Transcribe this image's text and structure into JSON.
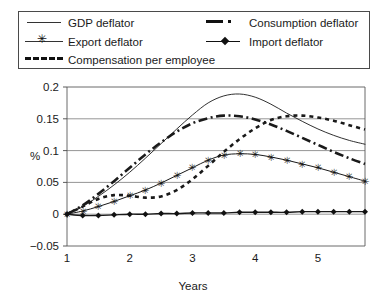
{
  "legend": {
    "entries": [
      {
        "label": "GDP deflator",
        "style": "solid-thin",
        "icon": "line-sample-solid-icon"
      },
      {
        "label": "Export deflator",
        "style": "star",
        "icon": "line-sample-star-icon"
      },
      {
        "label": "Compensation per employee",
        "style": "dash",
        "icon": "line-sample-dashed-icon"
      },
      {
        "label": "Consumption deflator",
        "style": "dashdot",
        "icon": "line-sample-dashdot-icon"
      },
      {
        "label": "Import deflator",
        "style": "diamond",
        "icon": "line-sample-diamond-icon"
      }
    ]
  },
  "axes": {
    "y_label": "%",
    "x_label": "Years",
    "y_ticks": [
      "0.2",
      "0.15",
      "0.1",
      "0.05",
      "0",
      "−0.05"
    ],
    "x_ticks": [
      "1",
      "2",
      "3",
      "4",
      "5"
    ]
  },
  "chart_data": {
    "type": "line",
    "title": "",
    "xlabel": "Years",
    "ylabel": "%",
    "xlim": [
      1,
      5.75
    ],
    "ylim": [
      -0.05,
      0.2
    ],
    "yticks": [
      -0.05,
      0,
      0.05,
      0.1,
      0.15,
      0.2
    ],
    "xticks": [
      1,
      2,
      3,
      4,
      5
    ],
    "grid": "horizontal",
    "legend_position": "top",
    "x": [
      1,
      1.25,
      1.5,
      1.75,
      2,
      2.25,
      2.5,
      2.75,
      3,
      3.25,
      3.5,
      3.75,
      4,
      4.25,
      4.5,
      4.75,
      5,
      5.25,
      5.5,
      5.75
    ],
    "series": [
      {
        "name": "GDP deflator",
        "style": "solid-thin",
        "values": [
          0.0,
          0.012,
          0.028,
          0.046,
          0.066,
          0.088,
          0.111,
          0.134,
          0.156,
          0.175,
          0.186,
          0.189,
          0.184,
          0.173,
          0.159,
          0.146,
          0.134,
          0.124,
          0.116,
          0.11
        ]
      },
      {
        "name": "Consumption deflator",
        "style": "dashdot",
        "values": [
          0.0,
          0.014,
          0.032,
          0.052,
          0.073,
          0.094,
          0.113,
          0.13,
          0.143,
          0.151,
          0.155,
          0.154,
          0.149,
          0.141,
          0.131,
          0.12,
          0.109,
          0.098,
          0.088,
          0.079
        ]
      },
      {
        "name": "Export deflator",
        "style": "star",
        "values": [
          0.0,
          0.005,
          0.012,
          0.02,
          0.029,
          0.038,
          0.049,
          0.061,
          0.073,
          0.085,
          0.093,
          0.095,
          0.094,
          0.09,
          0.085,
          0.079,
          0.073,
          0.066,
          0.059,
          0.052
        ]
      },
      {
        "name": "Compensation per employee",
        "style": "dash",
        "values": [
          0.0,
          0.012,
          0.024,
          0.03,
          0.029,
          0.026,
          0.028,
          0.038,
          0.055,
          0.076,
          0.098,
          0.118,
          0.135,
          0.148,
          0.154,
          0.155,
          0.152,
          0.147,
          0.14,
          0.133
        ]
      },
      {
        "name": "Import deflator",
        "style": "diamond",
        "values": [
          0.0,
          -0.002,
          -0.002,
          -0.001,
          0.0,
          0.0,
          0.001,
          0.001,
          0.002,
          0.002,
          0.002,
          0.003,
          0.003,
          0.003,
          0.003,
          0.004,
          0.004,
          0.004,
          0.004,
          0.004
        ]
      }
    ]
  }
}
